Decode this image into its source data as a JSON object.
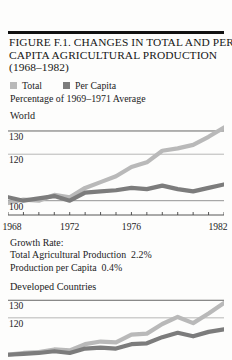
{
  "figure": {
    "title_lines": [
      "FIGURE F.1. CHANGES IN TOTAL AND PER",
      "CAPITA AGRICULTURAL PRODUCTION",
      "(1968–1982)"
    ],
    "subtitle": "Percentage of 1969–1971 Average",
    "legend": [
      {
        "label": "Total",
        "swatch": "light-gray-swatch",
        "color": "#b9b9b9"
      },
      {
        "label": "Per Capita",
        "swatch": "dark-gray-swatch",
        "color": "#7c7c7c"
      }
    ],
    "growth_rate": {
      "heading": "Growth Rate:",
      "rows": [
        {
          "label": "Total Agricultural Production",
          "value": "2.2%"
        },
        {
          "label": "Production per Capita",
          "value": "0.4%"
        }
      ]
    }
  },
  "chart_data": [
    {
      "type": "line",
      "title": "World",
      "panel": "world",
      "xlabel": "",
      "ylabel": "Percentage of 1969-1971 Average",
      "xlim": [
        1968,
        1982
      ],
      "ylim": [
        96,
        133
      ],
      "xticks": [
        1968,
        1969,
        1970,
        1971,
        1972,
        1973,
        1974,
        1975,
        1976,
        1977,
        1978,
        1979,
        1980,
        1981,
        1982
      ],
      "xticklabels": [
        "1968",
        "",
        "",
        "",
        "1972",
        "",
        "",
        "",
        "1976",
        "",
        "",
        "",
        "",
        "",
        "1982"
      ],
      "yticks": [
        100,
        120,
        130
      ],
      "yticklabels": [
        "100",
        "120",
        "130"
      ],
      "grid": true,
      "legend_position": "above-plot",
      "x": [
        1968,
        1969,
        1970,
        1971,
        1972,
        1973,
        1974,
        1975,
        1976,
        1977,
        1978,
        1979,
        1980,
        1981,
        1982
      ],
      "series": [
        {
          "name": "Total",
          "color": "#b9b9b9",
          "values": [
            99.0,
            100.5,
            100.0,
            102.5,
            101.5,
            105.5,
            108.0,
            110.5,
            114.5,
            116.5,
            121.5,
            122.5,
            124.0,
            127.5,
            131.5
          ]
        },
        {
          "name": "Per Capita",
          "color": "#7c7c7c",
          "values": [
            101.5,
            100.0,
            101.0,
            102.0,
            100.0,
            103.5,
            104.0,
            104.5,
            105.5,
            105.0,
            106.5,
            105.0,
            104.0,
            105.5,
            107.0
          ]
        }
      ]
    },
    {
      "type": "line",
      "title": "Developed Countries",
      "panel": "developed",
      "xlabel": "",
      "ylabel": "Percentage of 1969-1971 Average",
      "xlim": [
        1968,
        1982
      ],
      "ylim": [
        96,
        133
      ],
      "yticks": [
        120,
        130
      ],
      "yticklabels": [
        "120",
        "130"
      ],
      "grid": true,
      "x": [
        1968,
        1969,
        1970,
        1971,
        1972,
        1973,
        1974,
        1975,
        1976,
        1977,
        1978,
        1979,
        1980,
        1981,
        1982
      ],
      "series": [
        {
          "name": "Total",
          "color": "#b9b9b9",
          "values": [
            99.0,
            100.0,
            100.5,
            102.0,
            101.5,
            105.0,
            106.5,
            106.0,
            110.5,
            111.0,
            116.5,
            120.5,
            117.0,
            122.5,
            128.5
          ]
        },
        {
          "name": "Per Capita",
          "color": "#7c7c7c",
          "values": [
            99.0,
            99.5,
            100.0,
            101.0,
            100.0,
            102.5,
            103.0,
            102.5,
            105.0,
            105.5,
            109.0,
            111.5,
            109.5,
            112.0,
            113.5
          ]
        }
      ]
    }
  ]
}
